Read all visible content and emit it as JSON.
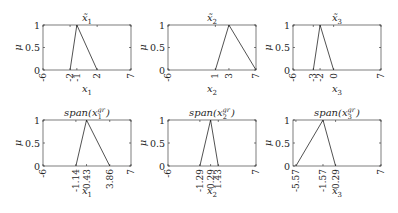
{
  "chart_data": [
    {
      "type": "line",
      "panel": "top-1",
      "title": "x̃1",
      "xlabel": "x1",
      "ylabel": "μ",
      "xlim": [
        -6,
        7
      ],
      "ylim": [
        0,
        1
      ],
      "xticks": [
        -6,
        -2,
        -1,
        2,
        7
      ],
      "xtick_labels": [
        "-6",
        "-2",
        "-1",
        "2",
        "7"
      ],
      "yticks": [
        0,
        0.5,
        1
      ],
      "ytick_labels": [
        "0",
        "0.5",
        "1"
      ],
      "grid": false,
      "series": [
        {
          "name": "membership",
          "x": [
            -2,
            -1,
            2
          ],
          "y": [
            0,
            1,
            0
          ]
        }
      ]
    },
    {
      "type": "line",
      "panel": "top-2",
      "title": "x̃2",
      "xlabel": "x2",
      "ylabel": "μ",
      "xlim": [
        -6,
        7
      ],
      "ylim": [
        0,
        1
      ],
      "xticks": [
        -6,
        1,
        3,
        7
      ],
      "xtick_labels": [
        "-6",
        "1",
        "3",
        "7"
      ],
      "yticks": [
        0,
        0.5,
        1
      ],
      "ytick_labels": [
        "0",
        "0.5",
        "1"
      ],
      "grid": false,
      "series": [
        {
          "name": "membership",
          "x": [
            1,
            3,
            7
          ],
          "y": [
            0,
            1,
            0
          ]
        }
      ]
    },
    {
      "type": "line",
      "panel": "top-3",
      "title": "x̃3",
      "xlabel": "x3",
      "ylabel": "μ",
      "xlim": [
        -6,
        7
      ],
      "ylim": [
        0,
        1
      ],
      "xticks": [
        -6,
        -3,
        -2,
        0,
        7
      ],
      "xtick_labels": [
        "-6",
        "-3",
        "-2",
        "0",
        "7"
      ],
      "yticks": [
        0,
        0.5,
        1
      ],
      "ytick_labels": [
        "0",
        "0.5",
        "1"
      ],
      "grid": false,
      "series": [
        {
          "name": "membership",
          "x": [
            -3,
            -2,
            0
          ],
          "y": [
            0,
            1,
            0
          ]
        }
      ]
    },
    {
      "type": "line",
      "panel": "bottom-1",
      "title": "span(x1^gr)",
      "xlabel": "x1",
      "ylabel": "μ",
      "xlim": [
        -6,
        7
      ],
      "ylim": [
        0,
        1
      ],
      "xticks": [
        -6,
        -1.14,
        0.43,
        3.86,
        7
      ],
      "xtick_labels": [
        "-6",
        "-1.14",
        "0.43",
        "3.86",
        "7"
      ],
      "yticks": [
        0,
        0.5,
        1
      ],
      "ytick_labels": [
        "0",
        "0.5",
        "1"
      ],
      "grid": false,
      "series": [
        {
          "name": "membership",
          "x": [
            -1.14,
            0.43,
            3.86
          ],
          "y": [
            0,
            1,
            0
          ]
        }
      ]
    },
    {
      "type": "line",
      "panel": "bottom-2",
      "title": "span(x2^gr)",
      "xlabel": "x2",
      "ylabel": "μ",
      "xlim": [
        -6,
        7
      ],
      "ylim": [
        0,
        1
      ],
      "xticks": [
        -6,
        -1.29,
        0.29,
        1.43,
        7
      ],
      "xtick_labels": [
        "-6",
        "-1.29",
        "0.29",
        "1.43",
        "7"
      ],
      "yticks": [
        0,
        0.5,
        1
      ],
      "ytick_labels": [
        "0",
        "0.5",
        "1"
      ],
      "grid": false,
      "series": [
        {
          "name": "membership",
          "x": [
            -1.29,
            0.29,
            1.43
          ],
          "y": [
            0,
            1,
            0
          ]
        }
      ]
    },
    {
      "type": "line",
      "panel": "bottom-3",
      "title": "span(x3^gr)",
      "xlabel": "x3",
      "ylabel": "μ",
      "xlim": [
        -6,
        7
      ],
      "ylim": [
        0,
        1
      ],
      "xticks": [
        -5.57,
        -1.57,
        0.29,
        7
      ],
      "xtick_labels": [
        "-5.57",
        "-1.57",
        "0.29",
        "7"
      ],
      "yticks": [
        0,
        0.5,
        1
      ],
      "ytick_labels": [
        "0",
        "0.5",
        "1"
      ],
      "grid": false,
      "series": [
        {
          "name": "membership",
          "x": [
            -5.57,
            -1.57,
            0.29
          ],
          "y": [
            0,
            1,
            0
          ]
        }
      ]
    }
  ],
  "panels": [
    {
      "title_base": "x̃",
      "title_sub": "1",
      "title_type": "tilde",
      "xlabel_base": "x",
      "xlabel_sub": "1",
      "ylabel": "μ"
    },
    {
      "title_base": "x̃",
      "title_sub": "2",
      "title_type": "tilde",
      "xlabel_base": "x",
      "xlabel_sub": "2",
      "ylabel": "μ"
    },
    {
      "title_base": "x̃",
      "title_sub": "3",
      "title_type": "tilde",
      "xlabel_base": "x",
      "xlabel_sub": "3",
      "ylabel": "μ"
    },
    {
      "title_pre": "span(",
      "title_base": "x",
      "title_sup": "gr",
      "title_sub": "1",
      "title_post": ")",
      "title_type": "span",
      "xlabel_base": "x",
      "xlabel_sub": "1",
      "ylabel": "μ"
    },
    {
      "title_pre": "span(",
      "title_base": "x",
      "title_sup": "gr",
      "title_sub": "2",
      "title_post": ")",
      "title_type": "span",
      "xlabel_base": "x",
      "xlabel_sub": "2",
      "ylabel": "μ"
    },
    {
      "title_pre": "span(",
      "title_base": "x",
      "title_sup": "gr",
      "title_sub": "3",
      "title_post": ")",
      "title_type": "span",
      "xlabel_base": "x",
      "xlabel_sub": "3",
      "ylabel": "μ"
    }
  ]
}
